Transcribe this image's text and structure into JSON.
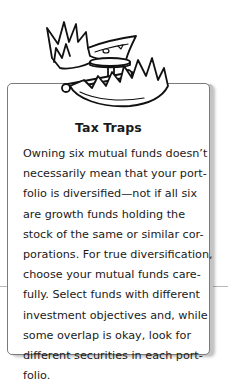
{
  "illustration": {
    "icon": "bear-trap-with-money-icon",
    "description": "Spring trap with a dollar bill as bait"
  },
  "sidebar": {
    "title": "Tax Traps",
    "body_lines": [
      "Owning six mutual funds doesn’t",
      "necessarily mean that your port-",
      "folio is diversified—not if all six",
      "are growth funds holding the",
      "stock of the same or similar cor-",
      "porations. For true diversification,",
      "choose your mutual funds care-",
      "fully. Select funds with different",
      "investment objectives and, while",
      "some overlap is okay, look for",
      "different securities in each port-",
      "folio."
    ]
  },
  "colors": {
    "border": "#7a7a7a",
    "shadow": "#c4c4c4",
    "text": "#1a1a1a",
    "rule": "#b8b8b8"
  }
}
